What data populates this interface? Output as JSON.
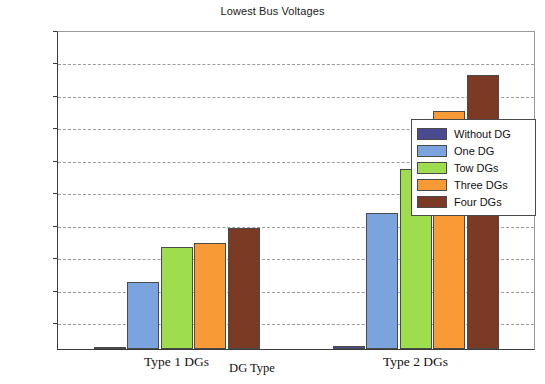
{
  "chart_data": {
    "type": "bar",
    "title": "Lowest Bus Voltages",
    "xlabel": "DG Type",
    "ylabel": "Bus Voltage (p.u)",
    "categories": [
      "Type 1 DGs",
      "Type 2 DGs"
    ],
    "ylim": [
      0.9017,
      1
    ],
    "yticks": [
      0.91,
      0.92,
      0.93,
      0.94,
      0.95,
      0.96,
      0.97,
      0.98,
      0.99,
      1
    ],
    "ytick_labels": [
      "0.91",
      "0.92",
      "0.93",
      "0.94",
      "0.95",
      "0.96",
      "0.97",
      "0.98",
      "0.99",
      "1"
    ],
    "grid": true,
    "legend_position": "right",
    "series": [
      {
        "name": "Without DG",
        "color": "#4a4a8f",
        "values": [
          0.9023,
          0.9025
        ]
      },
      {
        "name": "One DG",
        "color": "#7ba3dd",
        "values": [
          0.9225,
          0.9435
        ]
      },
      {
        "name": "Tow DGs",
        "color": "#9ede4e",
        "values": [
          0.9332,
          0.9572
        ]
      },
      {
        "name": "Three DGs",
        "color": "#f89a35",
        "values": [
          0.9343,
          0.975
        ]
      },
      {
        "name": "Four DGs",
        "color": "#7b3a23",
        "values": [
          0.939,
          0.9862
        ]
      }
    ]
  }
}
